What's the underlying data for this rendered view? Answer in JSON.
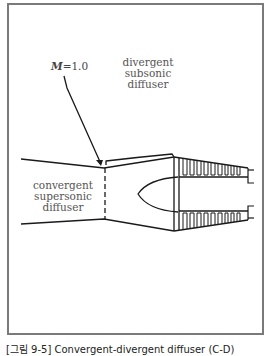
{
  "figure": {
    "labels": {
      "mach_symbol": "M",
      "mach_value": "=1.0",
      "divergent": [
        "divergent",
        "subsonic",
        "diffuser"
      ],
      "convergent": [
        "convergent",
        "supersonic",
        "diffuser"
      ]
    },
    "caption": "[그림 9-5] Convergent-divergent diffuser (C-D)",
    "colors": {
      "frame": "#7a7a7a",
      "line": "#1a1a1a",
      "label_text": "#555555"
    }
  }
}
